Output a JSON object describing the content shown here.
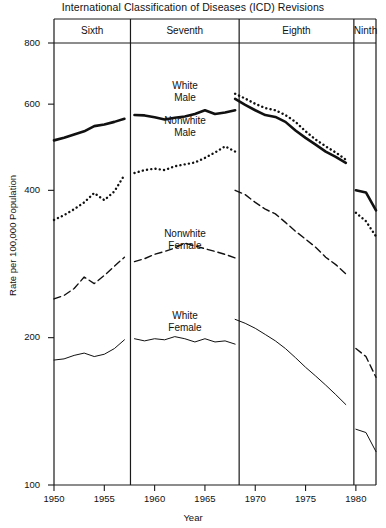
{
  "chart_data": {
    "type": "line",
    "title": "International Classification of Diseases (ICD) Revisions",
    "xlabel": "Year",
    "ylabel": "Rate per 100,000 Population",
    "yscale": "log",
    "ylim": [
      100,
      800
    ],
    "xlim": [
      1950,
      1982
    ],
    "grid": false,
    "legend_position": "inline-annotations",
    "yticks": [
      800,
      600,
      400,
      200,
      100
    ],
    "ytick_labels": [
      "800",
      "600",
      "400",
      "200",
      "100"
    ],
    "xticks": [
      1950,
      1955,
      1960,
      1965,
      1970,
      1975,
      1980
    ],
    "xtick_labels": [
      "1950",
      "1955",
      "1960",
      "1965",
      "1970",
      "1975",
      "1980"
    ],
    "panels": [
      {
        "label": "Sixth",
        "x_start": 1950,
        "x_end": 1957.6
      },
      {
        "label": "Seventh",
        "x_start": 1957.6,
        "x_end": 1968.4
      },
      {
        "label": "Eighth",
        "x_start": 1968.4,
        "x_end": 1979.8
      },
      {
        "label": "Ninth",
        "x_start": 1979.8,
        "x_end": 1982.5
      }
    ],
    "series": [
      {
        "name": "White Male",
        "style": "solid-thick",
        "label_text": "White\nMale",
        "segments": [
          {
            "x": [
              1950,
              1951,
              1952,
              1953,
              1954,
              1955,
              1956,
              1957
            ],
            "values": [
              506,
              512,
              520,
              528,
              541,
              545,
              552,
              560
            ]
          },
          {
            "x": [
              1958,
              1959,
              1960,
              1961,
              1962,
              1963,
              1964,
              1965,
              1966,
              1967,
              1968
            ],
            "values": [
              570,
              569,
              564,
              558,
              563,
              566,
              573,
              583,
              573,
              577,
              583
            ]
          },
          {
            "x": [
              1968,
              1969,
              1970,
              1971,
              1972,
              1973,
              1974,
              1975,
              1976,
              1977,
              1978,
              1979
            ],
            "values": [
              615,
              598,
              583,
              570,
              565,
              552,
              530,
              512,
              496,
              480,
              468,
              455
            ]
          },
          {
            "x": [
              1980,
              1981,
              1982
            ],
            "values": [
              400,
              396,
              364
            ]
          }
        ]
      },
      {
        "name": "Nonwhite Male",
        "style": "dotted",
        "label_text": "Nonwhite\nMale",
        "segments": [
          {
            "x": [
              1950,
              1951,
              1952,
              1953,
              1954,
              1955,
              1956,
              1957
            ],
            "values": [
              348,
              356,
              366,
              378,
              395,
              382,
              398,
              430
            ]
          },
          {
            "x": [
              1958,
              1959,
              1960,
              1961,
              1962,
              1963,
              1964,
              1965,
              1966,
              1967,
              1968
            ],
            "values": [
              434,
              440,
              443,
              440,
              448,
              452,
              456,
              466,
              478,
              492,
              480
            ]
          },
          {
            "x": [
              1968,
              1969,
              1970,
              1971,
              1972,
              1973,
              1974,
              1975,
              1976,
              1977,
              1978,
              1979
            ],
            "values": [
              630,
              616,
              601,
              589,
              583,
              570,
              552,
              528,
              508,
              492,
              478,
              462
            ]
          },
          {
            "x": [
              1980,
              1981,
              1982
            ],
            "values": [
              360,
              346,
              322
            ]
          }
        ]
      },
      {
        "name": "Nonwhite Female",
        "style": "dashed",
        "label_text": "Nonwhite\nFemale",
        "segments": [
          {
            "x": [
              1950,
              1951,
              1952,
              1953,
              1954,
              1955,
              1956,
              1957
            ],
            "values": [
              240,
              244,
              252,
              266,
              258,
              268,
              280,
              292
            ]
          },
          {
            "x": [
              1958,
              1959,
              1960,
              1961,
              1962,
              1963,
              1964,
              1965,
              1966,
              1967,
              1968
            ],
            "values": [
              286,
              290,
              296,
              300,
              305,
              312,
              308,
              304,
              300,
              296,
              291
            ]
          },
          {
            "x": [
              1968,
              1969,
              1970,
              1971,
              1972,
              1973,
              1974,
              1975,
              1976,
              1977,
              1978,
              1979
            ],
            "values": [
              400,
              392,
              378,
              366,
              358,
              344,
              330,
              318,
              306,
              292,
              282,
              270
            ]
          },
          {
            "x": [
              1980,
              1981,
              1982
            ],
            "values": [
              190,
              183,
              166
            ]
          }
        ]
      },
      {
        "name": "White Female",
        "style": "solid-thin",
        "label_text": "White\nFemale",
        "segments": [
          {
            "x": [
              1950,
              1951,
              1952,
              1953,
              1954,
              1955,
              1956,
              1957
            ],
            "values": [
              180,
              181,
              184,
              186,
              183,
              185,
              190,
              198
            ]
          },
          {
            "x": [
              1958,
              1959,
              1960,
              1961,
              1962,
              1963,
              1964,
              1965,
              1966,
              1967,
              1968
            ],
            "values": [
              199,
              197,
              199,
              198,
              201,
              199,
              196,
              199,
              196,
              197,
              194
            ]
          },
          {
            "x": [
              1968,
              1969,
              1970,
              1971,
              1972,
              1973,
              1974,
              1975,
              1976,
              1977,
              1978,
              1979
            ],
            "values": [
              218,
              214,
              209,
              203,
              197,
              190,
              182,
              174,
              167,
              160,
              153,
              146
            ]
          },
          {
            "x": [
              1980,
              1981,
              1982
            ],
            "values": [
              130,
              128,
              117
            ]
          }
        ]
      }
    ],
    "annotations": [
      {
        "text": "White\nMale",
        "x_px": 185,
        "y_px": 80
      },
      {
        "text": "Nonwhite\nMale",
        "x_px": 185,
        "y_px": 115
      },
      {
        "text": "Nonwhite\nFemale",
        "x_px": 185,
        "y_px": 228
      },
      {
        "text": "White\nFemale",
        "x_px": 185,
        "y_px": 310
      }
    ]
  }
}
